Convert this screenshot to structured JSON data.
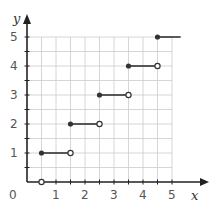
{
  "chart_data": {
    "type": "line",
    "subtype": "step-function",
    "title": "",
    "xlabel": "x",
    "ylabel": "y",
    "xlim": [
      0,
      5.3
    ],
    "ylim": [
      0,
      5.3
    ],
    "x_ticks": [
      "0",
      "1",
      "2",
      "3",
      "4",
      "5"
    ],
    "y_ticks": [
      "1",
      "2",
      "3",
      "4",
      "5"
    ],
    "grid": true,
    "grid_step": 0.5,
    "series": [
      {
        "name": "step",
        "segments": [
          {
            "x_start": 0.5,
            "x_end": 0.5,
            "y": 0,
            "start_closed": false,
            "end_closed": false,
            "point_only": true
          },
          {
            "x_start": 0.5,
            "x_end": 1.5,
            "y": 1,
            "start_closed": true,
            "end_closed": false
          },
          {
            "x_start": 1.5,
            "x_end": 2.5,
            "y": 2,
            "start_closed": true,
            "end_closed": false
          },
          {
            "x_start": 2.5,
            "x_end": 3.5,
            "y": 3,
            "start_closed": true,
            "end_closed": false
          },
          {
            "x_start": 3.5,
            "x_end": 4.5,
            "y": 4,
            "start_closed": true,
            "end_closed": false
          },
          {
            "x_start": 4.5,
            "x_end": 5.3,
            "y": 5,
            "start_closed": true,
            "end_closed": null
          }
        ]
      }
    ]
  },
  "colors": {
    "axis": "#222222",
    "grid": "#cccccc",
    "line": "#333333",
    "text": "#555555"
  }
}
